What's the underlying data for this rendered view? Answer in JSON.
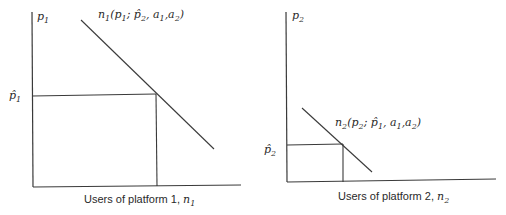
{
  "panels": [
    {
      "id": "platform1",
      "y_axis_label": {
        "base": "p",
        "sub": "1"
      },
      "equilibrium_price_label": {
        "base": "p̂",
        "sub": "1"
      },
      "curve_label": {
        "prefix": "n",
        "prefix_sub": "1",
        "text": "(p",
        "own_sub": "1",
        "sep": "; ",
        "other": "p̂",
        "other_sub": "2",
        "a1": ", a",
        "a1_sub": "1",
        "a2": ",a",
        "a2_sub": "2",
        "close": ")"
      },
      "x_axis_label": {
        "text": "Users of platform 1, ",
        "var": "n",
        "var_sub": "1"
      }
    },
    {
      "id": "platform2",
      "y_axis_label": {
        "base": "p",
        "sub": "2"
      },
      "equilibrium_price_label": {
        "base": "p̂",
        "sub": "2"
      },
      "curve_label": {
        "prefix": "n",
        "prefix_sub": "2",
        "text": "(p",
        "own_sub": "2",
        "sep": "; ",
        "other": "p̂",
        "other_sub": "1",
        "a1": ", a",
        "a1_sub": "1",
        "a2": ",a",
        "a2_sub": "2",
        "close": ")"
      },
      "x_axis_label": {
        "text": "Users of platform 2, ",
        "var": "n",
        "var_sub": "2"
      }
    }
  ]
}
